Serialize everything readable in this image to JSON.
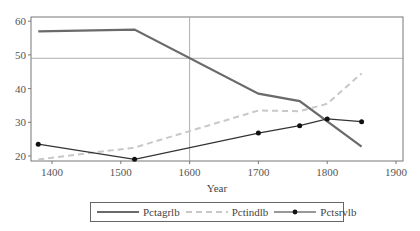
{
  "chart_data": {
    "type": "line",
    "title": "",
    "xlabel": "Year",
    "ylabel": "",
    "xlim": [
      1370,
      1905
    ],
    "ylim": [
      18,
      62
    ],
    "xticks": [
      1400,
      1500,
      1600,
      1700,
      1800,
      1900
    ],
    "yticks": [
      20,
      30,
      40,
      50,
      60
    ],
    "grid": false,
    "reference_lines": {
      "x": 1600,
      "y": 49
    },
    "legend_position": "bottom",
    "series": [
      {
        "name": "Pctagrlb",
        "style": "solid-thick",
        "color": "#6a6a6a",
        "x": [
          1380,
          1520,
          1700,
          1760,
          1850
        ],
        "y": [
          57,
          57.5,
          38.5,
          36.3,
          22.8
        ]
      },
      {
        "name": "Pctindlb",
        "style": "dashed",
        "color": "#c8c8c8",
        "x": [
          1380,
          1520,
          1700,
          1760,
          1800,
          1850
        ],
        "y": [
          19,
          22.5,
          33.5,
          33.3,
          35.5,
          44.5
        ]
      },
      {
        "name": "Pctsrvlb",
        "style": "solid-markers",
        "color": "#333333",
        "x": [
          1380,
          1520,
          1700,
          1760,
          1800,
          1850
        ],
        "y": [
          23.5,
          19,
          26.8,
          29,
          31,
          30.2
        ]
      }
    ]
  },
  "legend": {
    "items": [
      {
        "label": "Pctagrlb"
      },
      {
        "label": "Pctindlb"
      },
      {
        "label": "Pctsrvlb"
      }
    ]
  }
}
